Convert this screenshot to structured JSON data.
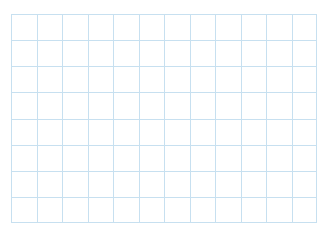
{
  "page": {
    "background_color": "#ffffff",
    "width": 329,
    "height": 240
  },
  "chart_data": {
    "type": "grid",
    "title": "",
    "subtitle": "",
    "xlabel": "",
    "ylabel": "",
    "tick_labels_x": [],
    "tick_labels_y": [],
    "legend": [],
    "annotations": [],
    "grid": true,
    "grid_color": "#c7e0f0",
    "grid_line_width": 1,
    "background_color": "#ffffff",
    "area": {
      "left": 11,
      "top": 14,
      "right": 317,
      "bottom": 223,
      "width": 306,
      "height": 209
    },
    "columns": 12,
    "rows": 8,
    "cell_width": 25.5,
    "cell_height": 26.1,
    "vertical_line_positions": [
      0,
      25.5,
      51,
      76.5,
      102,
      127.5,
      153,
      178.5,
      204,
      229.5,
      255,
      280.5,
      306
    ],
    "horizontal_line_positions": [
      0,
      26.1,
      52.2,
      78.4,
      104.5,
      130.6,
      156.8,
      182.9,
      209
    ]
  }
}
